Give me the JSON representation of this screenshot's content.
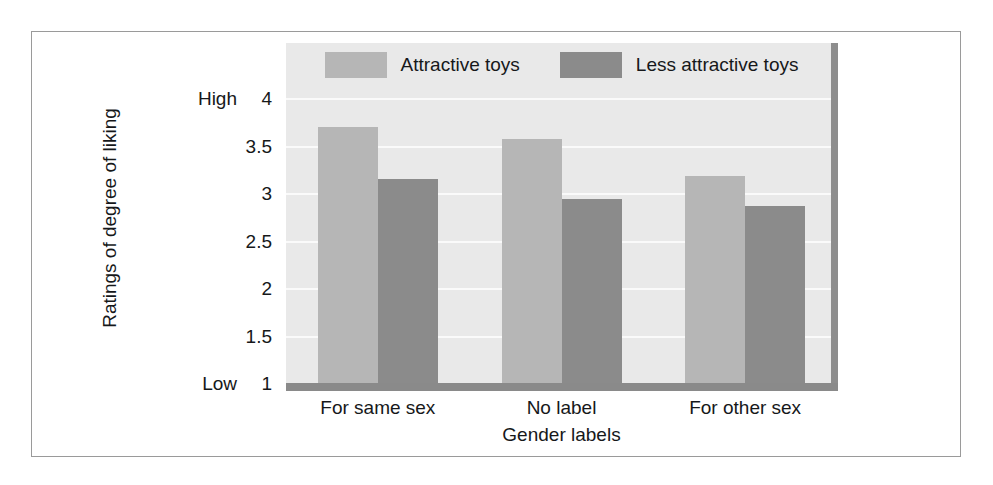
{
  "chart_data": {
    "type": "bar",
    "title": "",
    "xlabel": "Gender labels",
    "ylabel": "Ratings of degree of liking",
    "categories": [
      "For same sex",
      "No label",
      "For other sex"
    ],
    "series": [
      {
        "name": "Attractive toys",
        "values": [
          3.7,
          3.57,
          3.18
        ],
        "color": "#b6b6b6"
      },
      {
        "name": "Less attractive toys",
        "values": [
          3.15,
          2.94,
          2.86
        ],
        "color": "#8b8b8b"
      }
    ],
    "ylim": [
      1,
      4
    ],
    "yticks": [
      "4",
      "3.5",
      "3",
      "2.5",
      "2",
      "1.5",
      "1"
    ],
    "ytick_values": [
      4,
      3.5,
      3,
      2.5,
      2,
      1.5,
      1
    ],
    "y_axis_anchors": {
      "high_label": "High",
      "high_at": 4,
      "low_label": "Low",
      "low_at": 1
    },
    "grid": true,
    "legend_position": "top-center",
    "plot_background": "#e9e9e9",
    "gridline_color": "#fafafa",
    "axis_color": "#8a8a8a"
  },
  "legend": {
    "entries": [
      {
        "label": "Attractive toys"
      },
      {
        "label": "Less attractive toys"
      }
    ]
  },
  "axes": {
    "y_title": "Ratings of degree of liking",
    "x_title": "Gender labels",
    "high_label": "High",
    "low_label": "Low"
  }
}
